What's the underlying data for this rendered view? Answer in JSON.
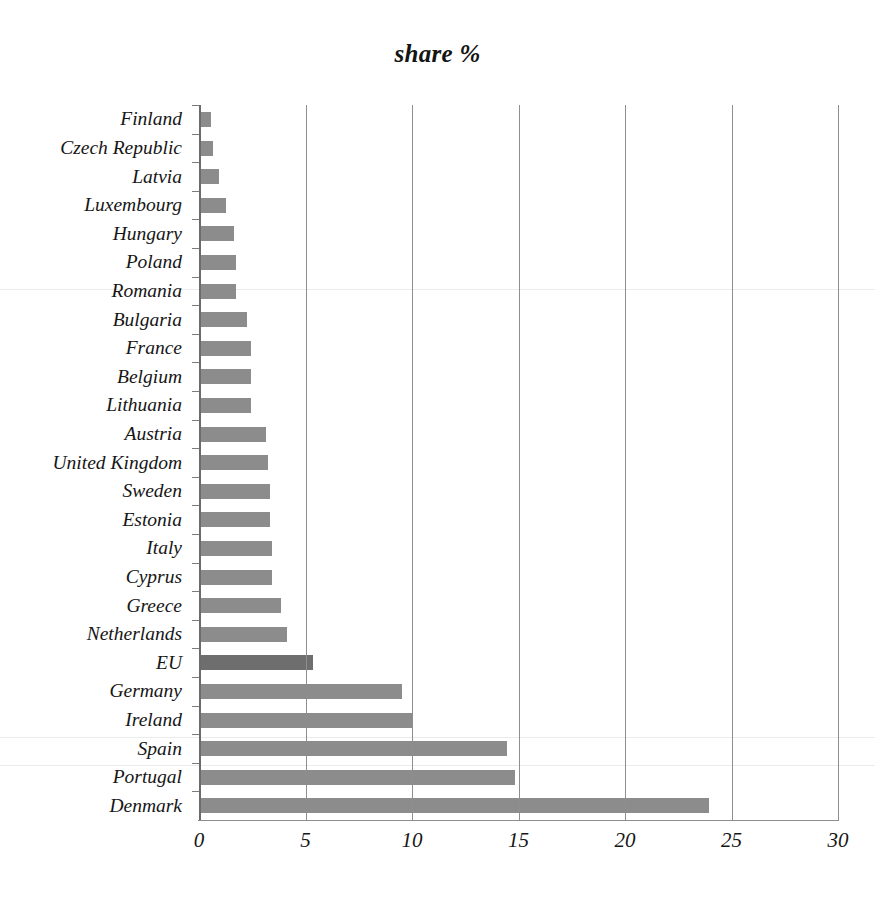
{
  "chart_data": {
    "type": "bar",
    "orientation": "horizontal",
    "title": "share %",
    "xlabel": "",
    "ylabel": "",
    "xlim": [
      0,
      30
    ],
    "xticks": [
      0,
      5,
      10,
      15,
      20,
      25,
      30
    ],
    "xtick_labels": [
      "0",
      "5",
      "10",
      "15",
      "20",
      "25",
      "30"
    ],
    "grid": "vertical gridlines at each x tick",
    "legend": "none",
    "bar_color": "#8c8c8c",
    "highlight_color": "#6e6e6e",
    "highlight_category": "EU",
    "categories": [
      "Finland",
      "Czech Republic",
      "Latvia",
      "Luxembourg",
      "Hungary",
      "Poland",
      "Romania",
      "Bulgaria",
      "France",
      "Belgium",
      "Lithuania",
      "Austria",
      "United Kingdom",
      "Sweden",
      "Estonia",
      "Italy",
      "Cyprus",
      "Greece",
      "Netherlands",
      "EU",
      "Germany",
      "Ireland",
      "Spain",
      "Portugal",
      "Denmark"
    ],
    "values": [
      0.5,
      0.6,
      0.9,
      1.2,
      1.6,
      1.7,
      1.7,
      2.2,
      2.4,
      2.4,
      2.4,
      3.1,
      3.2,
      3.3,
      3.3,
      3.4,
      3.4,
      3.8,
      4.1,
      5.3,
      9.5,
      10.0,
      14.4,
      14.8,
      23.9
    ]
  }
}
